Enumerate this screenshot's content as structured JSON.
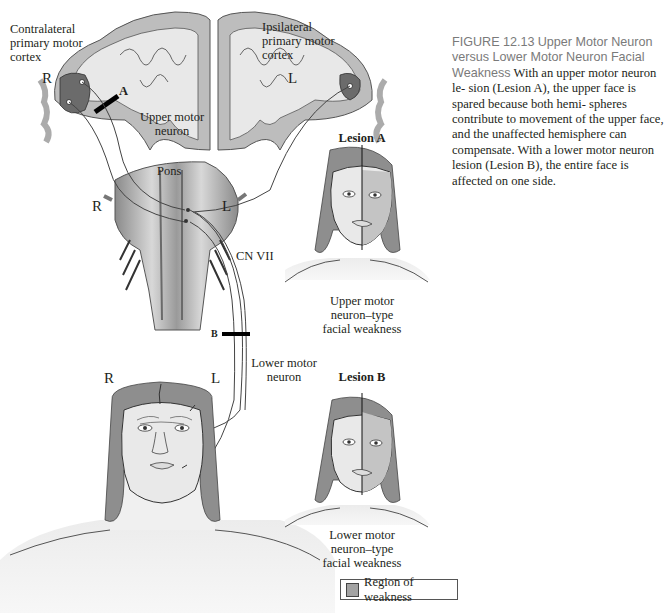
{
  "figure": {
    "number": "FIGURE 12.13",
    "title": "Upper Motor Neuron versus Lower Motor Neuron Facial Weakness",
    "caption_lines": [
      "sion (Lesion A), the upper face is spared because both hemi-",
      "spheres contribute to movement of the upper face, and the",
      "unaffected hemisphere can compensate. With a lower motor",
      "neuron lesion (Lesion B), the entire face is affected on one side."
    ],
    "caption_intro": "With an upper motor neuron le-"
  },
  "brain": {
    "contralateral_label": [
      "Contralateral",
      "primary motor",
      "cortex"
    ],
    "ipsilateral_label": [
      "Ipsilateral",
      "primary motor",
      "cortex"
    ],
    "side_right": "R",
    "side_left": "L",
    "upper_motor_neuron_label": [
      "Upper motor",
      "neuron"
    ],
    "lesion_a_marker": "A"
  },
  "brainstem": {
    "pons_label": "Pons",
    "side_right": "R",
    "side_left": "L",
    "cn_label": "CN VII",
    "lesion_b_marker": "B",
    "lower_motor_neuron_label": [
      "Lower motor",
      "neuron"
    ]
  },
  "main_face": {
    "side_right": "R",
    "side_left": "L"
  },
  "panel_a": {
    "title": "Lesion A",
    "caption": [
      "Upper motor",
      "neuron–type",
      "facial weakness"
    ]
  },
  "panel_b": {
    "title": "Lesion B",
    "caption": [
      "Lower motor",
      "neuron–type",
      "facial weakness"
    ]
  },
  "legend": {
    "label": "Region of weakness",
    "swatch_color": "#a3a3a3"
  },
  "colors": {
    "hair": "#8e8e8e",
    "skin": "#e9e9e9",
    "weak": "#c4c4c4",
    "cortex_gray": "#bdbdbd",
    "cortex_light": "#e8e8e8",
    "motor_area": "#6b6b6b",
    "caption_heading": "#7a7a7a"
  }
}
